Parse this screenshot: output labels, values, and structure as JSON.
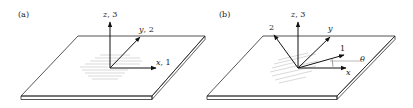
{
  "panels": [
    {
      "id": "a",
      "label": "(a)",
      "axes": {
        "z": {
          "var": "z",
          "num": "3",
          "text": "z, 3"
        },
        "y": {
          "var": "y",
          "num": "2",
          "text": "y, 2"
        },
        "x": {
          "var": "x",
          "num": "1",
          "text": "x, 1"
        }
      }
    },
    {
      "id": "b",
      "label": "(b)",
      "axes": {
        "z": {
          "var": "z",
          "num": "3",
          "text": "z, 3"
        },
        "two": {
          "text": "2"
        },
        "y": {
          "text": "y"
        },
        "one": {
          "text": "1"
        },
        "x": {
          "text": "x"
        },
        "angle": {
          "text": "θ"
        }
      }
    }
  ],
  "colors": {
    "line": "#2a2a2a",
    "hatch": "#bfbfbf",
    "background": "#ffffff"
  }
}
